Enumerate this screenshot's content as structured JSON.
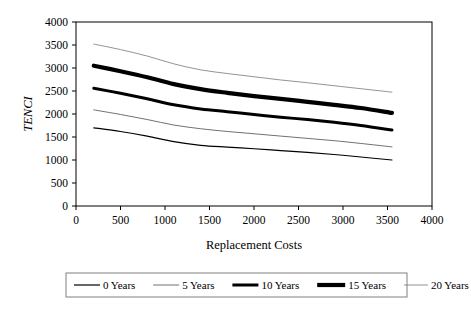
{
  "chart_data": {
    "type": "line",
    "title": "",
    "xlabel": "Replacement Costs",
    "ylabel": "TENCI",
    "xlim": [
      0,
      4000
    ],
    "ylim": [
      0,
      4000
    ],
    "xticks": [
      0,
      500,
      1000,
      1500,
      2000,
      2500,
      3000,
      3500,
      4000
    ],
    "yticks": [
      0,
      500,
      1000,
      1500,
      2000,
      2500,
      3000,
      3500,
      4000
    ],
    "xtick_labels": [
      "0",
      "500",
      "1000",
      "1500",
      "2000",
      "2500",
      "3000",
      "3500",
      "4000"
    ],
    "ytick_labels": [
      "0",
      "500",
      "1000",
      "1500",
      "2000",
      "2500",
      "3000",
      "3500",
      "4000"
    ],
    "grid": false,
    "legend_position": "bottom",
    "x": [
      200,
      500,
      800,
      1100,
      1400,
      1700,
      2000,
      2300,
      2600,
      2900,
      3200,
      3550
    ],
    "series": [
      {
        "name": "0 Years",
        "style": "thin-solid",
        "color": "#000000",
        "width": 1.2,
        "values": [
          1700,
          1620,
          1520,
          1400,
          1320,
          1280,
          1245,
          1205,
          1165,
          1120,
          1065,
          1000
        ]
      },
      {
        "name": "5 Years",
        "style": "hairline-solid",
        "color": "#4d4d4d",
        "width": 0.8,
        "values": [
          2090,
          1990,
          1880,
          1760,
          1680,
          1620,
          1570,
          1520,
          1470,
          1420,
          1360,
          1285
        ]
      },
      {
        "name": "10 Years",
        "style": "medium-solid",
        "color": "#000000",
        "width": 3.0,
        "values": [
          2560,
          2450,
          2330,
          2200,
          2110,
          2050,
          1990,
          1930,
          1880,
          1820,
          1750,
          1650
        ]
      },
      {
        "name": "15 Years",
        "style": "thick-solid",
        "color": "#000000",
        "width": 4.2,
        "values": [
          3050,
          2930,
          2800,
          2650,
          2540,
          2460,
          2390,
          2330,
          2265,
          2200,
          2130,
          2025
        ]
      },
      {
        "name": "20 Years",
        "style": "hairline-light",
        "color": "#777777",
        "width": 0.8,
        "values": [
          3520,
          3400,
          3260,
          3090,
          2960,
          2880,
          2810,
          2740,
          2680,
          2615,
          2550,
          2475
        ]
      }
    ]
  },
  "legend": {
    "items": [
      {
        "label": "0 Years"
      },
      {
        "label": "5 Years"
      },
      {
        "label": "10 Years"
      },
      {
        "label": "15 Years"
      },
      {
        "label": "20 Years"
      }
    ]
  }
}
